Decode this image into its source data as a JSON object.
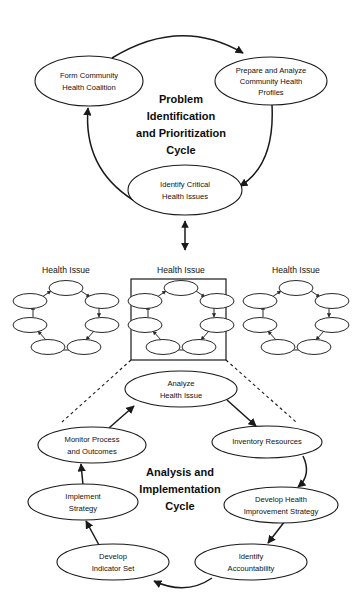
{
  "diagram": {
    "background_color": "#ffffff",
    "line_color": "#1a1a1a",
    "text_color": "#111111"
  },
  "top_cycle": {
    "title_lines": [
      "Problem",
      "Identification",
      "and Prioritization",
      "Cycle"
    ],
    "nodes": [
      {
        "id": "form-community-health-coalition",
        "lines": [
          "Form Community",
          "Health Coalition"
        ]
      },
      {
        "id": "prepare-and-analyze-community-health-profiles",
        "lines": [
          "Prepare and Analyze",
          "Community Health",
          "Profiles"
        ]
      },
      {
        "id": "identify-critical-health-issues",
        "lines": [
          "Identify Critical",
          "Health Issues"
        ]
      }
    ],
    "edges": [
      {
        "from": "form-community-health-coalition",
        "to": "prepare-and-analyze-community-health-profiles"
      },
      {
        "from": "prepare-and-analyze-community-health-profiles",
        "to": "identify-critical-health-issues"
      },
      {
        "from": "identify-critical-health-issues",
        "to": "form-community-health-coalition"
      }
    ]
  },
  "connector": {
    "type": "double-headed-arrow",
    "orientation": "vertical"
  },
  "health_issue_row": {
    "label": "Health Issue",
    "groups": [
      {
        "id": "health-issue-left",
        "label": "Health Issue",
        "highlighted": false,
        "node_count": 7
      },
      {
        "id": "health-issue-center",
        "label": "Health Issue",
        "highlighted": true,
        "node_count": 7
      },
      {
        "id": "health-issue-right",
        "label": "Health Issue",
        "highlighted": false,
        "node_count": 7
      }
    ]
  },
  "bottom_cycle": {
    "title_lines": [
      "Analysis and",
      "Implementation",
      "Cycle"
    ],
    "nodes": [
      {
        "id": "analyze-health-issue",
        "lines": [
          "Analyze",
          "Health Issue"
        ]
      },
      {
        "id": "inventory-resources",
        "lines": [
          "Inventory Resources"
        ]
      },
      {
        "id": "develop-health-improvement-strategy",
        "lines": [
          "Develop Health",
          "Improvement Strategy"
        ]
      },
      {
        "id": "identify-accountability",
        "lines": [
          "Identify",
          "Accountability"
        ]
      },
      {
        "id": "develop-indicator-set",
        "lines": [
          "Develop",
          "Indicator Set"
        ]
      },
      {
        "id": "implement-strategy",
        "lines": [
          "Implement",
          "Strategy"
        ]
      },
      {
        "id": "monitor-process-and-outcomes",
        "lines": [
          "Monitor Process",
          "and Outcomes"
        ]
      }
    ],
    "edges": [
      {
        "from": "analyze-health-issue",
        "to": "inventory-resources"
      },
      {
        "from": "inventory-resources",
        "to": "develop-health-improvement-strategy"
      },
      {
        "from": "develop-health-improvement-strategy",
        "to": "identify-accountability"
      },
      {
        "from": "identify-accountability",
        "to": "develop-indicator-set"
      },
      {
        "from": "develop-indicator-set",
        "to": "implement-strategy"
      },
      {
        "from": "implement-strategy",
        "to": "monitor-process-and-outcomes"
      },
      {
        "from": "monitor-process-and-outcomes",
        "to": "analyze-health-issue"
      }
    ]
  }
}
